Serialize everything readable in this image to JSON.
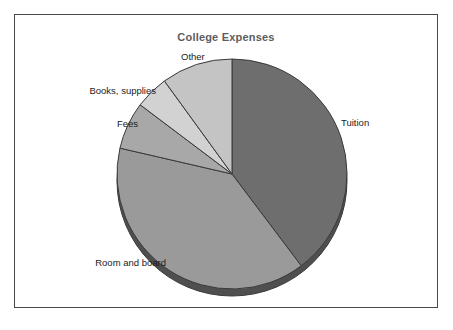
{
  "figure": {
    "title": "College Expenses",
    "background_color": "#ffffff",
    "frame_color": "#4a4a4a"
  },
  "chart_data": {
    "type": "pie",
    "title": "College Expenses",
    "xlabel": "",
    "ylabel": "",
    "legend_position": "none",
    "labels_position": "outside-callout",
    "grid": false,
    "start_angle_deg": 0,
    "direction": "clockwise",
    "categories": [
      "Tuition",
      "Room and board",
      "Fees",
      "Books, supplies",
      "Other"
    ],
    "values": [
      39.7,
      38.9,
      6.7,
      4.7,
      10.0
    ],
    "units": "percent",
    "slices": [
      {
        "label": "Tuition",
        "value": 39.7,
        "angle_deg": 143.0,
        "start_deg": 0.0,
        "end_deg": 143.0,
        "color": "#6e6e6e",
        "label_side": "right"
      },
      {
        "label": "Room and board",
        "value": 38.9,
        "angle_deg": 140.0,
        "start_deg": 143.0,
        "end_deg": 283.0,
        "color": "#9a9a9a",
        "label_side": "left"
      },
      {
        "label": "Fees",
        "value": 6.7,
        "angle_deg": 24.0,
        "start_deg": 283.0,
        "end_deg": 307.0,
        "color": "#a8a8a8",
        "label_side": "left"
      },
      {
        "label": "Books, supplies",
        "value": 4.7,
        "angle_deg": 17.0,
        "start_deg": 307.0,
        "end_deg": 324.0,
        "color": "#d2d2d2",
        "label_side": "left"
      },
      {
        "label": "Other",
        "value": 10.0,
        "angle_deg": 36.0,
        "start_deg": 324.0,
        "end_deg": 360.0,
        "color": "#c4c4c4",
        "label_side": "top"
      }
    ],
    "geometry": {
      "center_x": 232,
      "center_y": 174,
      "radius": 115,
      "depth_px": 7,
      "edge_color": "#3a3a3a",
      "shadow_color": "#4f4f4f"
    }
  },
  "labels": {
    "other": "Other",
    "books_supplies": "Books, supplies",
    "fees": "Fees",
    "room_and_board": "Room and board",
    "tuition": "Tuition"
  }
}
